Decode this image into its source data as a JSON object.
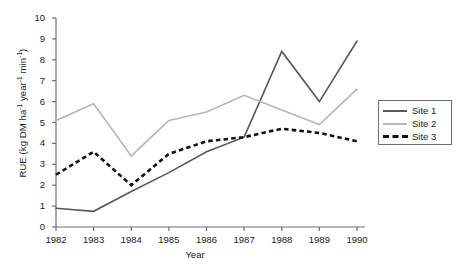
{
  "chart_data": {
    "type": "line",
    "title": "",
    "xlabel": "Year",
    "ylabel": "RUE (kg DM ha⁻¹ year⁻¹ min⁻¹)",
    "ylabel_parts": {
      "prefix": "RUE (kg DM ha",
      "sup1": "-1",
      "mid1": " year",
      "sup2": "-1",
      "mid2": " min",
      "sup3": "-1",
      "suffix": ")"
    },
    "categories": [
      "1982",
      "1983",
      "1984",
      "1985",
      "1986",
      "1987",
      "1988",
      "1989",
      "1990"
    ],
    "x": [
      1982,
      1983,
      1984,
      1985,
      1986,
      1987,
      1988,
      1989,
      1990
    ],
    "xlim": [
      1982,
      1990
    ],
    "ylim": [
      0,
      10
    ],
    "yticks": [
      "10",
      "9",
      "8",
      "7",
      "6",
      "5",
      "4",
      "3",
      "2",
      "1",
      "0"
    ],
    "ytick_values": [
      10,
      9,
      8,
      7,
      6,
      5,
      4,
      3,
      2,
      1,
      0
    ],
    "grid": false,
    "legend_position": "right-outside",
    "series": [
      {
        "name": "Site 1",
        "style": "solid",
        "color": "#595959",
        "values": [
          0.9,
          0.75,
          1.7,
          2.6,
          3.6,
          4.3,
          8.4,
          6.0,
          8.9
        ]
      },
      {
        "name": "Site 2",
        "style": "solid",
        "color": "#b6b6b6",
        "values": [
          5.1,
          5.9,
          3.4,
          5.1,
          5.5,
          6.3,
          5.6,
          4.9,
          6.6
        ]
      },
      {
        "name": "Site 3",
        "style": "dashed",
        "color": "#111111",
        "values": [
          2.5,
          3.6,
          2.0,
          3.5,
          4.1,
          4.3,
          4.7,
          4.5,
          4.1
        ]
      }
    ]
  },
  "legend": {
    "items": [
      {
        "label": "Site 1"
      },
      {
        "label": "Site 2"
      },
      {
        "label": "Site 3"
      }
    ]
  },
  "axes": {
    "axis_color": "#6e6e6e"
  }
}
